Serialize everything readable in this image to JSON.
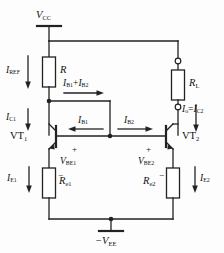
{
  "diagram": {
    "stroke_color": "#222222",
    "background_color": "#fdfdfd"
  },
  "supplies": {
    "top_rail": {
      "name": "V",
      "sub": "CC"
    },
    "bottom_rail": {
      "sign": "-",
      "name": "V",
      "sub": "EE"
    }
  },
  "resistors": [
    {
      "id": "r-ref",
      "name": "R",
      "sub": ""
    },
    {
      "id": "r-load",
      "name": "R",
      "sub": "L"
    },
    {
      "id": "r-e1",
      "name": "R",
      "sub": "e1"
    },
    {
      "id": "r-e2",
      "name": "R",
      "sub": "e2"
    }
  ],
  "transistors": [
    {
      "id": "vt1",
      "name": "VT",
      "sub": "1"
    },
    {
      "id": "vt2",
      "name": "VT",
      "sub": "2"
    }
  ],
  "currents": [
    {
      "id": "i-ref",
      "name": "I",
      "sub": "REF",
      "direction": "down"
    },
    {
      "id": "i-c1",
      "name": "I",
      "sub": "C1",
      "direction": "down"
    },
    {
      "id": "i-b-sum",
      "name": "I",
      "sub": "B1",
      "op": "+",
      "name2": "I",
      "sub2": "B2",
      "direction": "right"
    },
    {
      "id": "i-b1",
      "name": "I",
      "sub": "B1",
      "direction": "left"
    },
    {
      "id": "i-b2",
      "name": "I",
      "sub": "B2",
      "direction": "right"
    },
    {
      "id": "i-out",
      "name": "I",
      "sub": "o",
      "op": "=",
      "name2": "I",
      "sub2": "C2",
      "direction": "down"
    },
    {
      "id": "i-e1",
      "name": "I",
      "sub": "E1",
      "direction": "down"
    },
    {
      "id": "i-e2",
      "name": "I",
      "sub": "E2",
      "direction": "down"
    }
  ],
  "voltages": [
    {
      "id": "v-be1",
      "name": "V",
      "sub": "BE1",
      "plus": "+",
      "minus": "−"
    },
    {
      "id": "v-be2",
      "name": "V",
      "sub": "BE2",
      "plus": "+",
      "minus": "−"
    }
  ],
  "labels": {
    "vcc": "V",
    "vcc_sub": "CC",
    "vee": "−V",
    "vee_sub": "EE",
    "r": "R",
    "rl": "R",
    "rl_sub": "L",
    "re1": "R",
    "re1_sub": "e1",
    "re2": "R",
    "re2_sub": "e2",
    "vt1": "VT",
    "vt1_sub": "1",
    "vt2": "VT",
    "vt2_sub": "2",
    "iref": "I",
    "iref_sub": "REF",
    "ic1": "I",
    "ic1_sub": "C1",
    "ib1": "I",
    "ib1_sub": "B1",
    "ib2": "I",
    "ib2_sub": "B2",
    "ibsum_1": "I",
    "ibsum_1_sub": "B1",
    "ibsum_op": "+",
    "ibsum_2": "I",
    "ibsum_2_sub": "B2",
    "io_1": "I",
    "io_1_sub": "o",
    "io_op": "=",
    "io_2": "I",
    "io_2_sub": "C2",
    "ie1": "I",
    "ie1_sub": "E1",
    "ie2": "I",
    "ie2_sub": "E2",
    "vbe1": "V",
    "vbe1_sub": "BE1",
    "vbe2": "V",
    "vbe2_sub": "BE2",
    "plus1": "+",
    "minus1": "−",
    "plus2": "+",
    "minus2": "−"
  }
}
